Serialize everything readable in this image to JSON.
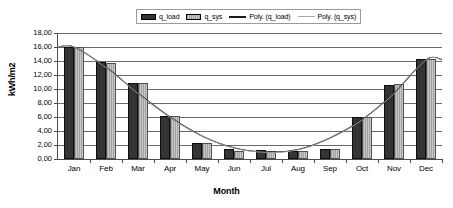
{
  "chart_data": {
    "type": "bar",
    "title": "",
    "xlabel": "Month",
    "ylabel": "kWh/m2",
    "categories": [
      "Jan",
      "Feb",
      "Mar",
      "Apr",
      "May",
      "Jun",
      "Jul",
      "Aug",
      "Sep",
      "Oct",
      "Nov",
      "Dec"
    ],
    "series": [
      {
        "name": "q_load",
        "type": "bar",
        "color": "#333333",
        "values": [
          16.0,
          13.8,
          10.9,
          6.2,
          2.3,
          1.4,
          1.35,
          1.15,
          1.4,
          6.0,
          10.6,
          14.3
        ]
      },
      {
        "name": "q_sys",
        "type": "bar",
        "color": "#b0b0b0",
        "values": [
          16.0,
          13.75,
          10.9,
          6.2,
          2.25,
          1.1,
          1.2,
          1.1,
          1.4,
          6.0,
          10.65,
          14.25
        ]
      },
      {
        "name": "Poly. (q_load)",
        "type": "trendline",
        "color": "#1a1a1a",
        "values": [
          16.0,
          13.1,
          9.4,
          6.0,
          3.3,
          1.6,
          1.0,
          1.35,
          3.0,
          5.6,
          9.4,
          14.2
        ]
      },
      {
        "name": "Poly. (q_sys)",
        "type": "trendline",
        "color": "#a8a8a8",
        "values": [
          16.0,
          13.05,
          9.35,
          5.95,
          3.25,
          1.55,
          0.95,
          1.3,
          2.95,
          5.55,
          9.35,
          14.15
        ]
      }
    ],
    "ylim": [
      0,
      18
    ],
    "ytick_step": 2,
    "ytick_labels": [
      "0,00",
      "2,00",
      "4,00",
      "6,00",
      "8,00",
      "10,00",
      "12,00",
      "14,00",
      "16,00",
      "18,00"
    ],
    "ytick_values": [
      0,
      2,
      4,
      6,
      8,
      10,
      12,
      14,
      16,
      18
    ],
    "grid": true,
    "legend_position": "top-center"
  },
  "legend": {
    "entries": [
      {
        "label": "q_load",
        "marker": "bar-dark"
      },
      {
        "label": "q_sys",
        "marker": "bar-light-hatched"
      },
      {
        "label": "Poly. (q_load)",
        "marker": "line-dark"
      },
      {
        "label": "Poly. (q_sys)",
        "marker": "line-light"
      }
    ]
  },
  "axes": {
    "y_title": "kWh/m2",
    "x_title": "Month"
  }
}
